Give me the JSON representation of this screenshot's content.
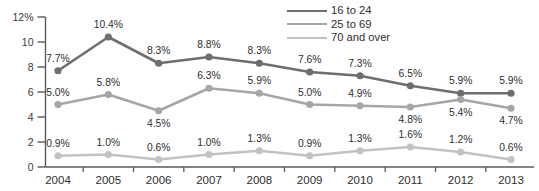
{
  "chart_data": {
    "type": "line",
    "title": "",
    "subtitle": "",
    "xlabel": "",
    "ylabel": "",
    "categories": [
      "2004",
      "2005",
      "2006",
      "2007",
      "2008",
      "2009",
      "2010",
      "2011",
      "2012",
      "2013"
    ],
    "ylim": [
      0,
      12
    ],
    "yticks": [
      0,
      2,
      4,
      6,
      8,
      10,
      12
    ],
    "ytick_labels": [
      "0",
      "2",
      "4",
      "6",
      "8",
      "10",
      "12%"
    ],
    "grid": false,
    "legend_position": "top-right",
    "value_suffix": "%",
    "series": [
      {
        "name": "16 to 24",
        "color": "#6e6e6e",
        "values": [
          7.7,
          10.4,
          8.3,
          8.8,
          8.3,
          7.6,
          7.3,
          6.5,
          5.9,
          5.9
        ],
        "labels": [
          "7.7%",
          "10.4%",
          "8.3%",
          "8.8%",
          "8.3%",
          "7.6%",
          "7.3%",
          "6.5%",
          "5.9%",
          "5.9%"
        ]
      },
      {
        "name": "25 to 69",
        "color": "#a6a6a6",
        "values": [
          5.0,
          5.8,
          4.5,
          6.3,
          5.9,
          5.0,
          4.9,
          4.8,
          5.4,
          4.7
        ],
        "labels": [
          "5.0%",
          "5.8%",
          "4.5%",
          "6.3%",
          "5.9%",
          "5.0%",
          "4.9%",
          "4.8%",
          "5.4%",
          "4.7%"
        ]
      },
      {
        "name": "70 and over",
        "color": "#c2c2c2",
        "values": [
          0.9,
          1.0,
          0.6,
          1.0,
          1.3,
          0.9,
          1.3,
          1.6,
          1.2,
          0.6
        ],
        "labels": [
          "0.9%",
          "1.0%",
          "0.6%",
          "1.0%",
          "1.3%",
          "0.9%",
          "1.3%",
          "1.6%",
          "1.2%",
          "0.6%"
        ]
      }
    ]
  },
  "axis": {
    "line_color": "#5a5a5a"
  }
}
